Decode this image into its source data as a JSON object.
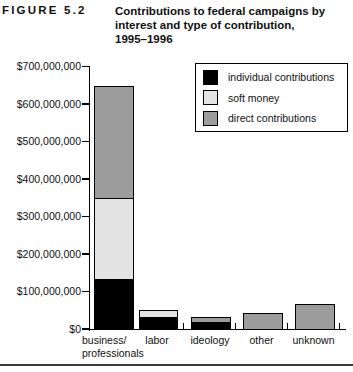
{
  "figure": {
    "label": "FIGURE 5.2",
    "title_lines": [
      "Contributions to federal campaigns by",
      "interest and type of contribution,",
      "1995–1996"
    ]
  },
  "legend": {
    "items": [
      {
        "name": "individual-contributions",
        "label": "individual contributions",
        "color": "#000000"
      },
      {
        "name": "soft-money",
        "label": "soft money",
        "color": "#e3e3e3"
      },
      {
        "name": "direct-contributions",
        "label": "direct contributions",
        "color": "#9c9c9c"
      }
    ]
  },
  "chart_data": {
    "type": "bar",
    "stacked": true,
    "title": "Contributions to federal campaigns by interest and type of contribution, 1995–1996",
    "xlabel": "",
    "ylabel": "",
    "categories": [
      "business/ professionals",
      "labor",
      "ideology",
      "other",
      "unknown"
    ],
    "category_label_lines": [
      [
        "business/",
        "professionals"
      ],
      [
        "labor"
      ],
      [
        "ideology"
      ],
      [
        "other"
      ],
      [
        "unknown"
      ]
    ],
    "series": [
      {
        "name": "individual contributions",
        "color": "#000000",
        "values": [
          135000000,
          33000000,
          19000000,
          0,
          0
        ]
      },
      {
        "name": "soft money",
        "color": "#e3e3e3",
        "values": [
          215000000,
          15000000,
          0,
          0,
          0
        ]
      },
      {
        "name": "direct contributions",
        "color": "#9c9c9c",
        "values": [
          295000000,
          0,
          10000000,
          40000000,
          65000000
        ]
      }
    ],
    "totals": [
      645000000,
      48000000,
      29000000,
      40000000,
      65000000
    ],
    "ylim": [
      0,
      700000000
    ],
    "y_axis": {
      "tick_step": 100000000,
      "tick_labels": [
        "$0",
        "$100,000,000",
        "$200,000,000",
        "$300,000,000",
        "$400,000,000",
        "$500,000,000",
        "$600,000,000",
        "$700,000,000"
      ]
    },
    "legend_position": "upper right",
    "grid": false
  }
}
